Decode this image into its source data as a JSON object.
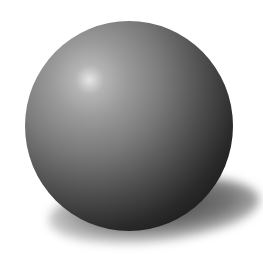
{
  "scene": {
    "subject": "shaded gray sphere with cast shadow",
    "background_color": "#ffffff",
    "sphere": {
      "center": [
        129,
        126
      ],
      "radius": 104,
      "highlight_position": [
        90,
        80
      ],
      "highlight_color": "#e6e6e6",
      "midtone_color": "#7a7a7a",
      "shadow_side_color": "#161616"
    },
    "cast_shadow": {
      "direction": "lower-right",
      "color": "#3a3a3a"
    }
  }
}
